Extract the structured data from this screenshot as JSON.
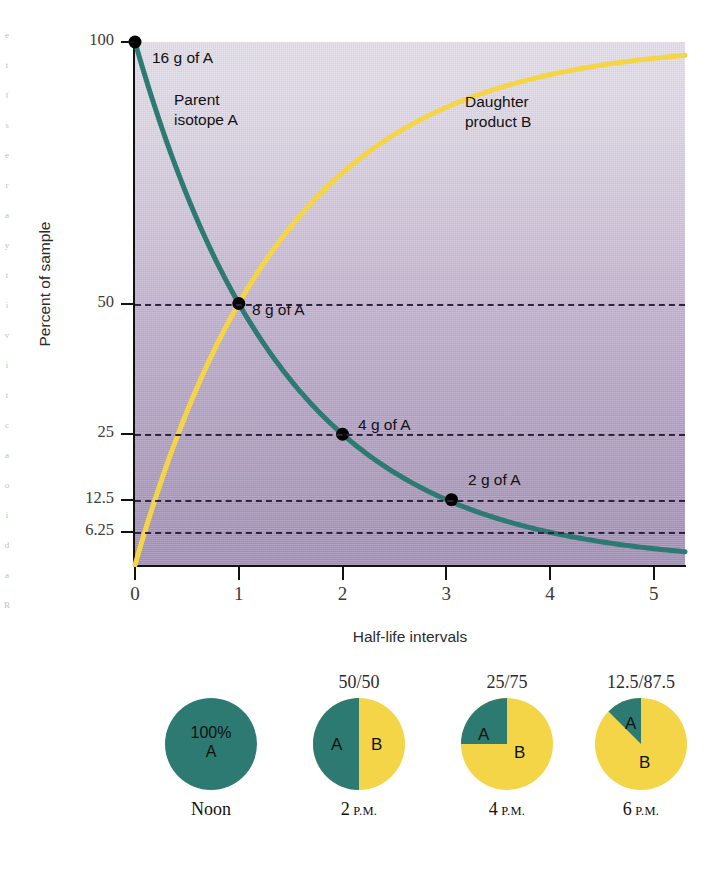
{
  "margin_artifact": [
    "e",
    "t",
    "f",
    "s",
    "e",
    "r",
    "a",
    "y",
    "t",
    "i",
    "v",
    "i",
    "t",
    "c",
    "a",
    "o",
    "i",
    "d",
    "a",
    "R"
  ],
  "chart_data": {
    "type": "line",
    "title": "",
    "xlabel": "Half-life intervals",
    "ylabel": "Percent of sample",
    "xlim": [
      0,
      5.3
    ],
    "ylim": [
      0,
      100
    ],
    "grid": true,
    "legend": "inline-annotations",
    "x_ticks": [
      "0",
      "1",
      "2",
      "3",
      "4",
      "5"
    ],
    "x_tick_values": [
      0,
      1,
      2,
      3,
      4,
      5
    ],
    "y_ticks": [
      "100",
      "50",
      "25",
      "12.5",
      "6.25"
    ],
    "y_tick_values": [
      100,
      50,
      25,
      12.5,
      6.25
    ],
    "series": [
      {
        "name": "Parent isotope A",
        "color": "#2d7a72",
        "formula": "100 * 0.5^x",
        "x": [
          0,
          0.5,
          1,
          1.5,
          2,
          2.5,
          3,
          3.5,
          4,
          4.5,
          5,
          5.3
        ],
        "values": [
          100,
          70.7,
          50,
          35.4,
          25,
          17.7,
          12.5,
          8.8,
          6.25,
          4.4,
          3.125,
          2.5
        ]
      },
      {
        "name": "Daughter product B",
        "color": "#f5d548",
        "formula": "100 - 100 * 0.5^x",
        "x": [
          0,
          0.5,
          1,
          1.5,
          2,
          2.5,
          3,
          3.5,
          4,
          4.5,
          5,
          5.3
        ],
        "values": [
          0,
          29.3,
          50,
          64.6,
          75,
          82.3,
          87.5,
          91.2,
          93.75,
          95.6,
          96.875,
          97.5
        ]
      }
    ],
    "points": [
      {
        "label": "16 g of A",
        "x": 0,
        "y": 100
      },
      {
        "label": "8 g of A",
        "x": 1,
        "y": 50
      },
      {
        "label": "4 g of A",
        "x": 2,
        "y": 25
      },
      {
        "label": "2 g of A",
        "x": 3.05,
        "y": 12.5
      }
    ],
    "annotations": [
      {
        "name": "parent-curve-label",
        "text": "Parent\nisotope A"
      },
      {
        "name": "daughter-curve-label",
        "text": "Daughter\nproduct B"
      }
    ]
  },
  "pies": {
    "colors": {
      "parent": "#2d7a72",
      "daughter": "#f5d548"
    },
    "items": [
      {
        "top_label": "",
        "center_label": "100%\nA",
        "a_label": "",
        "b_label": "",
        "percent_a": 100,
        "time": "Noon",
        "time_suffix": ""
      },
      {
        "top_label": "50/50",
        "center_label": "",
        "a_label": "A",
        "b_label": "B",
        "percent_a": 50,
        "time": "2",
        "time_suffix": "P.M."
      },
      {
        "top_label": "25/75",
        "center_label": "",
        "a_label": "A",
        "b_label": "B",
        "percent_a": 25,
        "time": "4",
        "time_suffix": "P.M."
      },
      {
        "top_label": "12.5/87.5",
        "center_label": "",
        "a_label": "A",
        "b_label": "B",
        "percent_a": 12.5,
        "time": "6",
        "time_suffix": "P.M."
      }
    ]
  }
}
